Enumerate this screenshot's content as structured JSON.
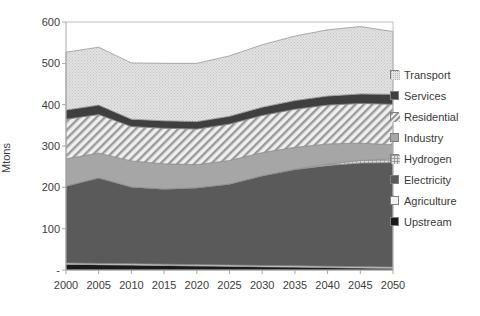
{
  "chart_data": {
    "type": "area",
    "stacked": true,
    "title": "",
    "xlabel": "",
    "ylabel": "Mtons",
    "x": [
      2000,
      2005,
      2010,
      2015,
      2020,
      2025,
      2030,
      2035,
      2040,
      2045,
      2050
    ],
    "xtick_labels": [
      "2000",
      "2005",
      "2010",
      "2015",
      "2020",
      "2025",
      "2030",
      "2035",
      "2040",
      "2045",
      "2050"
    ],
    "ytick_labels": [
      "-",
      "100",
      "200",
      "300",
      "400",
      "500",
      "600"
    ],
    "ytick_values": [
      0,
      100,
      200,
      300,
      400,
      500,
      600
    ],
    "ylim": [
      0,
      600
    ],
    "xlim": [
      2000,
      2050
    ],
    "grid": false,
    "legend_position": "right",
    "series": [
      {
        "name": "Upstream",
        "color": "#1a1a1a",
        "pattern": "solid",
        "values": [
          14,
          13,
          12,
          11,
          10,
          9,
          8,
          7,
          6,
          5,
          4
        ]
      },
      {
        "name": "Agriculture",
        "color": "#f2f2f2",
        "pattern": "solid",
        "values": [
          3,
          3,
          3,
          3,
          3,
          3,
          3,
          3,
          3,
          3,
          3
        ]
      },
      {
        "name": "Electricity",
        "color": "#5a5a5a",
        "pattern": "solid",
        "values": [
          186,
          207,
          186,
          182,
          186,
          196,
          217,
          233,
          244,
          251,
          253
        ]
      },
      {
        "name": "Hydrogen",
        "color": "#d0d0d0",
        "pattern": "fine-grid",
        "values": [
          0,
          0,
          0,
          0,
          0,
          0,
          0,
          1,
          3,
          6,
          9
        ]
      },
      {
        "name": "Industry",
        "color": "#a6a6a6",
        "pattern": "solid",
        "values": [
          66,
          60,
          63,
          61,
          56,
          57,
          56,
          53,
          49,
          42,
          34
        ]
      },
      {
        "name": "Residential",
        "color": "#e8e8e8",
        "pattern": "diagonal-hatch",
        "values": [
          96,
          93,
          83,
          86,
          86,
          88,
          90,
          92,
          94,
          96,
          98
        ]
      },
      {
        "name": "Services",
        "color": "#3f3f3f",
        "pattern": "solid",
        "values": [
          22,
          23,
          18,
          18,
          18,
          19,
          20,
          21,
          22,
          23,
          24
        ]
      },
      {
        "name": "Transport",
        "color": "#dcdcdc",
        "pattern": "dotted-fill",
        "values": [
          140,
          140,
          136,
          139,
          141,
          146,
          151,
          156,
          160,
          163,
          152
        ]
      }
    ],
    "legend_entries": [
      {
        "label": "Transport",
        "color": "#dcdcdc",
        "pattern": "dotted-fill"
      },
      {
        "label": "Services",
        "color": "#3f3f3f",
        "pattern": "solid"
      },
      {
        "label": "Residential",
        "color": "#e8e8e8",
        "pattern": "diagonal-hatch"
      },
      {
        "label": "Industry",
        "color": "#a6a6a6",
        "pattern": "solid"
      },
      {
        "label": "Hydrogen",
        "color": "#d0d0d0",
        "pattern": "fine-grid"
      },
      {
        "label": "Electricity",
        "color": "#5a5a5a",
        "pattern": "solid"
      },
      {
        "label": "Agriculture",
        "color": "#f2f2f2",
        "pattern": "solid"
      },
      {
        "label": "Upstream",
        "color": "#1a1a1a",
        "pattern": "solid"
      }
    ],
    "totals": [
      527,
      539,
      501,
      500,
      500,
      518,
      545,
      566,
      581,
      589,
      577
    ]
  },
  "colors": {
    "axis": "#a6a6a6",
    "tick_text": "#404040",
    "plot_border": "#bfbfbf",
    "background": "#ffffff"
  }
}
